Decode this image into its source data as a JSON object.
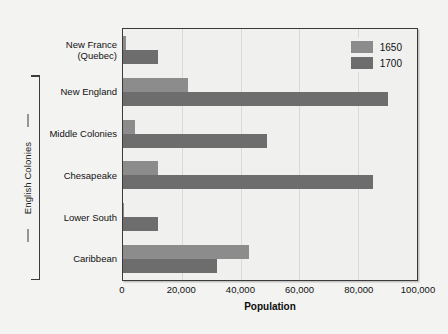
{
  "chart_data": {
    "type": "bar",
    "orientation": "horizontal",
    "title": "",
    "xlabel": "Population",
    "ylabel": "",
    "xlim": [
      0,
      100000
    ],
    "xticks": [
      0,
      20000,
      40000,
      60000,
      80000,
      100000
    ],
    "xticklabels": [
      "0",
      "20,000",
      "40,000",
      "60,000",
      "80,000",
      "100,000"
    ],
    "grid": true,
    "legend_position": "top-right",
    "categories": [
      "New France (Quebec)",
      "New England",
      "Middle Colonies",
      "Chesapeake",
      "Lower South",
      "Caribbean"
    ],
    "category_lines": [
      [
        "New France",
        "(Quebec)"
      ],
      [
        "New England"
      ],
      [
        "Middle Colonies"
      ],
      [
        "Chesapeake"
      ],
      [
        "Lower South"
      ],
      [
        "Caribbean"
      ]
    ],
    "series": [
      {
        "name": "1650",
        "color": "#8c8c8c",
        "values": [
          1000,
          22000,
          4000,
          12000,
          500,
          43000
        ]
      },
      {
        "name": "1700",
        "color": "#6d6d6d",
        "values": [
          12000,
          90000,
          49000,
          85000,
          12000,
          32000
        ]
      }
    ],
    "group_annotation": {
      "label": "English Colonies",
      "spans_categories": [
        "New England",
        "New England",
        "Middle Colonies",
        "Chesapeake",
        "Lower South",
        "Caribbean"
      ]
    }
  },
  "legend": {
    "items": [
      {
        "label": "1650",
        "color": "#8c8c8c"
      },
      {
        "label": "1700",
        "color": "#6d6d6d"
      }
    ]
  },
  "axis": {
    "x_title": "Population",
    "x_ticklabels": [
      "0",
      "20,000",
      "40,000",
      "60,000",
      "80,000",
      "100,000"
    ]
  },
  "annotations": {
    "bracket_label": "English Colonies"
  },
  "colors": {
    "background": "#f3f3f1",
    "plot_background": "#f0f0ee",
    "frame": "#3a3a3a",
    "gridline": "#d9d9d7",
    "series_1650": "#8c8c8c",
    "series_1700": "#6d6d6d",
    "text": "#111111"
  }
}
